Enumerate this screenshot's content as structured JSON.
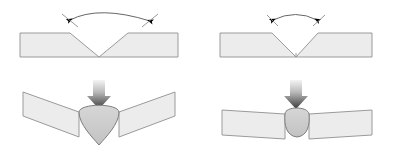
{
  "figure": {
    "background_color": "#ffffff",
    "width": 394,
    "height": 154,
    "text_labels": []
  },
  "colors": {
    "plate_fill": "#ececec",
    "plate_stroke": "#9a9a9a",
    "weld_fill": "#c9c9c9",
    "weld_stroke": "#7d7d7d",
    "arc_stroke": "#555555",
    "arrowhead_fill": "#000000",
    "block_arrow_light": "#f2f2f2",
    "block_arrow_dark": "#3a3a3a"
  },
  "panels": [
    {
      "id": "top-left",
      "name": "wide-groove-before-welding",
      "stage": "before",
      "groove_type": "single-V-butt",
      "groove_angle_deg": 90,
      "groove_width_px": 80,
      "plate": {
        "x": 20,
        "y": 33,
        "width": 158,
        "height": 24
      },
      "angle_arc": {
        "from_x": 70,
        "from_y": 19,
        "to_x": 150,
        "to_y": 19,
        "arrowheads": 2,
        "arrowhead_direction": "outward"
      }
    },
    {
      "id": "top-right",
      "name": "narrow-groove-before-welding",
      "stage": "before",
      "groove_type": "single-V-butt",
      "groove_angle_deg": 45,
      "groove_width_px": 46,
      "plate": {
        "x": 220,
        "y": 33,
        "width": 152,
        "height": 24
      },
      "angle_arc": {
        "from_x": 272,
        "from_y": 19,
        "to_x": 318,
        "to_y": 19,
        "arrowheads": 2,
        "arrowhead_direction": "outward"
      }
    },
    {
      "id": "bottom-left",
      "name": "wide-groove-after-welding-high-distortion",
      "stage": "after",
      "distortion": "high",
      "distortion_angle_deg": 20,
      "weld_bead": {
        "shape": "triangular-convex",
        "width": 40,
        "height": 44
      },
      "block_arrow": {
        "x": 99,
        "y": 80,
        "direction": "down"
      }
    },
    {
      "id": "bottom-right",
      "name": "narrow-groove-after-welding-low-distortion",
      "stage": "after",
      "distortion": "low",
      "distortion_angle_deg": 3,
      "weld_bead": {
        "shape": "rounded-convex",
        "width": 26,
        "height": 34
      },
      "block_arrow": {
        "x": 296,
        "y": 80,
        "direction": "down"
      }
    }
  ]
}
